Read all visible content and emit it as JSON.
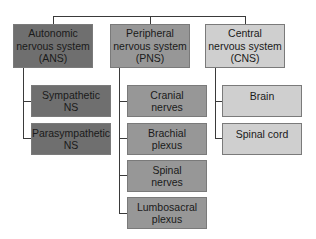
{
  "diagram": {
    "type": "hierarchy",
    "colors": {
      "ans": "#6f6f6f",
      "pns": "#979797",
      "cns": "#cfcfcf",
      "lines": "#3a3a3a"
    },
    "top_level": [
      {
        "label": "Autonomic\nnervous system\n(ANS)",
        "children": [
          "Sympathetic\nNS",
          "Parasympathetic\nNS"
        ]
      },
      {
        "label": "Peripheral\nnervous system\n(PNS)",
        "children": [
          "Cranial\nnerves",
          "Brachial\nplexus",
          "Spinal\nnerves",
          "Lumbosacral\nplexus"
        ]
      },
      {
        "label": "Central\nnervous system\n(CNS)",
        "children": [
          "Brain",
          "Spinal cord"
        ]
      }
    ]
  }
}
